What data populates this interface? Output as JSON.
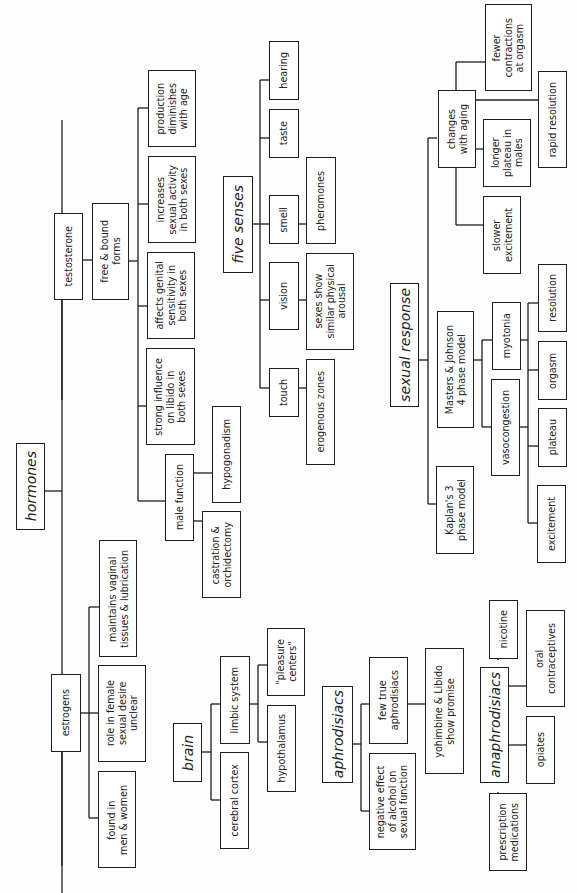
{
  "diagram": {
    "orientation": "rotated-90-ccw",
    "nodes": {
      "hormones": "hormones",
      "testosterone": "testosterone",
      "free_bound": "free & bound\nforms",
      "production_diminishes": "production\ndiminishes\nwith age",
      "increases_activity": "increases\nsexual activity\nin both sexes",
      "genital_sensitivity": "affects genital\nsensitivity in\nboth sexes",
      "strong_influence": "strong influence\non libido in\nboth sexes",
      "male_function": "male function",
      "hypogonadism": "hypogonadism",
      "castration": "castration &\norchidectomy",
      "estrogens": "estrogens",
      "maintains_vaginal": "maintains vaginal\ntissues & lubrication",
      "role_female": "role in female\nsexual desire\nunclear",
      "found_in": "found  in\nmen & women",
      "brain": "brain",
      "cerebral_cortex": "cerebral cortex",
      "limbic_system": "limbic system",
      "hypothalamus": "hypothalamus",
      "pleasure_centers": "\"pleasure\ncenters\"",
      "five_senses": "five senses",
      "touch": "touch",
      "vision": "vision",
      "smell": "smell",
      "taste": "taste",
      "hearing": "hearing",
      "erogenous_zones": "erogenous zones",
      "sexes_show": "sexes show\nsimilar physical\narousal",
      "pheromones": "pheromones",
      "sexual_response": "sexual response",
      "kaplan": "Kaplan's 3\nphase model",
      "masters_johnson": "Masters & Johnson\n4 phase model",
      "vasocongestion": "vasocongestion",
      "myotonia": "myotonia",
      "excitement": "excitement",
      "plateau": "plateau",
      "orgasm": "orgasm",
      "resolution": "resolution",
      "changes_aging": "changes\nwith aging",
      "slower_excitement": "slower\nexcitement",
      "longer_plateau": "longer\nplateau in\nmales",
      "rapid_resolution": "rapid resolution",
      "fewer_contractions": "fewer\ncontractions\nat orgasm",
      "aphrodisiacs": "aphrodisiacs",
      "negative_alcohol": "negative effect\nof alcohol on\nsexual function",
      "few_true": "few true\naphrodisiacs",
      "yohimbine": "yohimbine & Libido\nshow promise",
      "anaphrodisiacs": "anaphrodisiacs",
      "prescription": "prescription\nmedications",
      "opiates": "opiates",
      "oral_contraceptives": "oral\ncontraceptives",
      "nicotine": "nicotine"
    }
  }
}
